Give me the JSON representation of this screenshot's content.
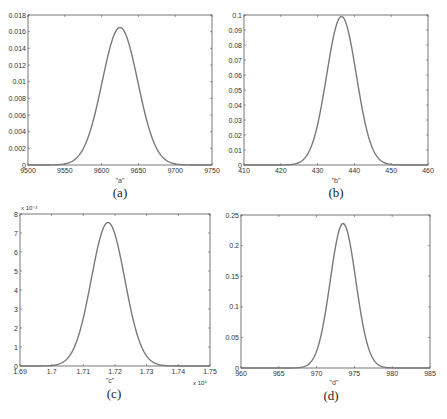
{
  "chart_data": [
    {
      "type": "line",
      "panel_label": "(a)",
      "xlabel": "\"a\"",
      "ylabel": "",
      "xlim": [
        9500,
        9750
      ],
      "ylim": [
        0,
        0.018
      ],
      "xticks": [
        "9500",
        "9550",
        "9600",
        "9650",
        "9700",
        "9750"
      ],
      "yticks": [
        "0",
        "0.002",
        "0.004",
        "0.006",
        "0.008",
        "0.01",
        "0.012",
        "0.014",
        "0.016",
        "0.018"
      ],
      "x_exponent": "",
      "y_exponent": "",
      "grid": false,
      "series": [
        {
          "name": "pdf a",
          "distribution": "gaussian",
          "mean": 9625,
          "sigma": 24.2,
          "peak": 0.0165
        }
      ]
    },
    {
      "type": "line",
      "panel_label": "(b)",
      "xlabel": "\"b\"",
      "ylabel": "",
      "xlim": [
        410,
        460
      ],
      "ylim": [
        0,
        0.1
      ],
      "xticks": [
        "410",
        "420",
        "430",
        "440",
        "450",
        "460"
      ],
      "yticks": [
        "0",
        "0.01",
        "0.02",
        "0.03",
        "0.04",
        "0.05",
        "0.06",
        "0.07",
        "0.08",
        "0.09",
        "0.1"
      ],
      "x_exponent": "",
      "y_exponent": "",
      "grid": false,
      "series": [
        {
          "name": "pdf b",
          "distribution": "gaussian",
          "mean": 436.5,
          "sigma": 4.03,
          "peak": 0.099
        }
      ]
    },
    {
      "type": "line",
      "panel_label": "(c)",
      "xlabel": "\"c\"",
      "ylabel": "",
      "xlim": [
        1.69,
        1.75
      ],
      "ylim": [
        0,
        8
      ],
      "xticks": [
        "1.69",
        "1.7",
        "1.71",
        "1.72",
        "1.73",
        "1.74",
        "1.75"
      ],
      "yticks": [
        "0",
        "1",
        "2",
        "3",
        "4",
        "5",
        "6",
        "7",
        "8"
      ],
      "x_exponent": "x 10⁴",
      "y_exponent": "x 10⁻³",
      "grid": false,
      "series": [
        {
          "name": "pdf c",
          "distribution": "gaussian",
          "mean": 1.7178,
          "sigma": 0.00528,
          "peak": 7.55
        }
      ]
    },
    {
      "type": "line",
      "panel_label": "(d)",
      "xlabel": "\"d\"",
      "ylabel": "",
      "xlim": [
        960,
        985
      ],
      "ylim": [
        0,
        0.25
      ],
      "xticks": [
        "960",
        "965",
        "970",
        "975",
        "980",
        "985"
      ],
      "yticks": [
        "0",
        "0.05",
        "0.1",
        "0.15",
        "0.2",
        "0.25"
      ],
      "x_exponent": "",
      "y_exponent": "",
      "grid": false,
      "series": [
        {
          "name": "pdf d",
          "distribution": "gaussian",
          "mean": 973.5,
          "sigma": 1.69,
          "peak": 0.236
        }
      ]
    }
  ],
  "style": {
    "curve_color": "#7a7a7a",
    "axis_color": "#555555"
  }
}
